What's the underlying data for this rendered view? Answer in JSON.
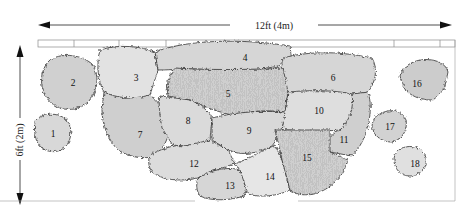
{
  "diagram": {
    "type": "planting-plan",
    "width_label": "12ft (4m)",
    "height_label": "6ft (2m)",
    "colors": {
      "outline": "#333333",
      "fill_light": "#e2e2e2",
      "fill_mid": "#d2d2d2",
      "fill_dark": "#c4c4c4",
      "fence": "#888888",
      "guide": "#999999"
    },
    "plants": [
      {
        "id": "1",
        "label": "1"
      },
      {
        "id": "2",
        "label": "2"
      },
      {
        "id": "3",
        "label": "3"
      },
      {
        "id": "4",
        "label": "4"
      },
      {
        "id": "5",
        "label": "5"
      },
      {
        "id": "6",
        "label": "6"
      },
      {
        "id": "7",
        "label": "7"
      },
      {
        "id": "8",
        "label": "8"
      },
      {
        "id": "9",
        "label": "9"
      },
      {
        "id": "10",
        "label": "10"
      },
      {
        "id": "11",
        "label": "11"
      },
      {
        "id": "12",
        "label": "12"
      },
      {
        "id": "13",
        "label": "13"
      },
      {
        "id": "14",
        "label": "14"
      },
      {
        "id": "15",
        "label": "15"
      },
      {
        "id": "16",
        "label": "16"
      },
      {
        "id": "17",
        "label": "17"
      },
      {
        "id": "18",
        "label": "18"
      }
    ]
  }
}
